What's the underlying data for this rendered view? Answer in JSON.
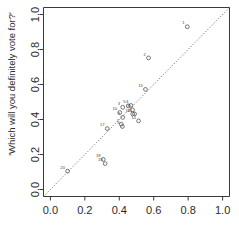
{
  "chart_data": {
    "type": "scatter",
    "title": "",
    "subtitle": "",
    "xlabel": "",
    "ylabel": "'Which will you definitely vote for?'",
    "xlim": [
      -0.04,
      1.04
    ],
    "ylim": [
      -0.04,
      1.04
    ],
    "grid": false,
    "legend": null,
    "xticks": [
      "0.0",
      "0.2",
      "0.4",
      "0.6",
      "0.8",
      "1.0"
    ],
    "xtick_values": [
      0.0,
      0.2,
      0.4,
      0.6,
      0.8,
      1.0
    ],
    "yticks": [
      "0.0",
      "0.2",
      "0.4",
      "0.6",
      "0.8",
      "1.0"
    ],
    "ytick_values": [
      0.0,
      0.2,
      0.4,
      0.6,
      0.8,
      1.0
    ],
    "annotations": [
      {
        "text": "identity line y = x",
        "type": "dotted-diagonal"
      }
    ],
    "point_label_position": "above-left",
    "points": [
      {
        "label": "1",
        "x": 0.795,
        "y": 0.93
      },
      {
        "label": "2",
        "x": 0.57,
        "y": 0.752
      },
      {
        "label": "15",
        "x": 0.552,
        "y": 0.572
      },
      {
        "label": "4",
        "x": 0.468,
        "y": 0.48
      },
      {
        "label": "5",
        "x": 0.452,
        "y": 0.478
      },
      {
        "label": "3",
        "x": 0.42,
        "y": 0.47
      },
      {
        "label": "8",
        "x": 0.477,
        "y": 0.455
      },
      {
        "label": "10",
        "x": 0.403,
        "y": 0.44
      },
      {
        "label": "12",
        "x": 0.478,
        "y": 0.432
      },
      {
        "label": "11",
        "x": 0.489,
        "y": 0.432
      },
      {
        "label": "9",
        "x": 0.42,
        "y": 0.412
      },
      {
        "label": "14",
        "x": 0.512,
        "y": 0.392
      },
      {
        "label": "7",
        "x": 0.412,
        "y": 0.373
      },
      {
        "label": "6",
        "x": 0.418,
        "y": 0.36
      },
      {
        "label": "17",
        "x": 0.33,
        "y": 0.348
      },
      {
        "label": "18",
        "x": 0.307,
        "y": 0.172
      },
      {
        "label": "19",
        "x": 0.318,
        "y": 0.148
      },
      {
        "label": "20",
        "x": 0.1,
        "y": 0.105
      }
    ]
  },
  "colors": {
    "background": "#ffffff",
    "axis": "#3a3a3a",
    "text": "#2b2b2b",
    "point": "#555555",
    "identity_line": "#4a4a4a"
  }
}
